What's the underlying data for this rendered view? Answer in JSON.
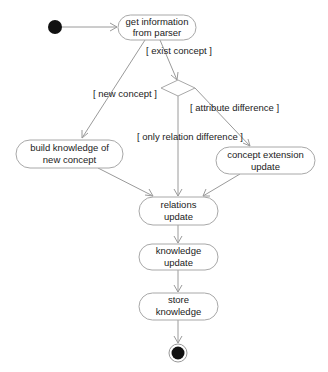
{
  "diagram": {
    "type": "activity",
    "nodes": {
      "start": {
        "kind": "initial"
      },
      "get_info": {
        "kind": "action",
        "lines": [
          "get information",
          "from parser"
        ]
      },
      "decision": {
        "kind": "decision"
      },
      "build": {
        "kind": "action",
        "lines": [
          "build knowledge of",
          "new concept"
        ]
      },
      "extension": {
        "kind": "action",
        "lines": [
          "concept extension",
          "update"
        ]
      },
      "relations": {
        "kind": "action",
        "lines": [
          "relations",
          "update"
        ]
      },
      "knowledge": {
        "kind": "action",
        "lines": [
          "knowledge",
          "update"
        ]
      },
      "store": {
        "kind": "action",
        "lines": [
          "store",
          "knowledge"
        ]
      },
      "end": {
        "kind": "final"
      }
    },
    "guards": {
      "exist_concept": "[ exist concept ]",
      "new_concept": "[ new concept ]",
      "attribute_difference": "[ attribute difference ]",
      "only_relation_difference": "[ only relation difference ]"
    },
    "edges": [
      {
        "from": "start",
        "to": "get_info",
        "guard": ""
      },
      {
        "from": "get_info",
        "to": "decision",
        "guard": "exist_concept"
      },
      {
        "from": "get_info",
        "to": "build",
        "guard": "new_concept"
      },
      {
        "from": "decision",
        "to": "extension",
        "guard": "attribute_difference"
      },
      {
        "from": "decision",
        "to": "relations",
        "guard": "only_relation_difference"
      },
      {
        "from": "build",
        "to": "relations",
        "guard": ""
      },
      {
        "from": "extension",
        "to": "relations",
        "guard": ""
      },
      {
        "from": "relations",
        "to": "knowledge",
        "guard": ""
      },
      {
        "from": "knowledge",
        "to": "store",
        "guard": ""
      },
      {
        "from": "store",
        "to": "end",
        "guard": ""
      }
    ]
  }
}
